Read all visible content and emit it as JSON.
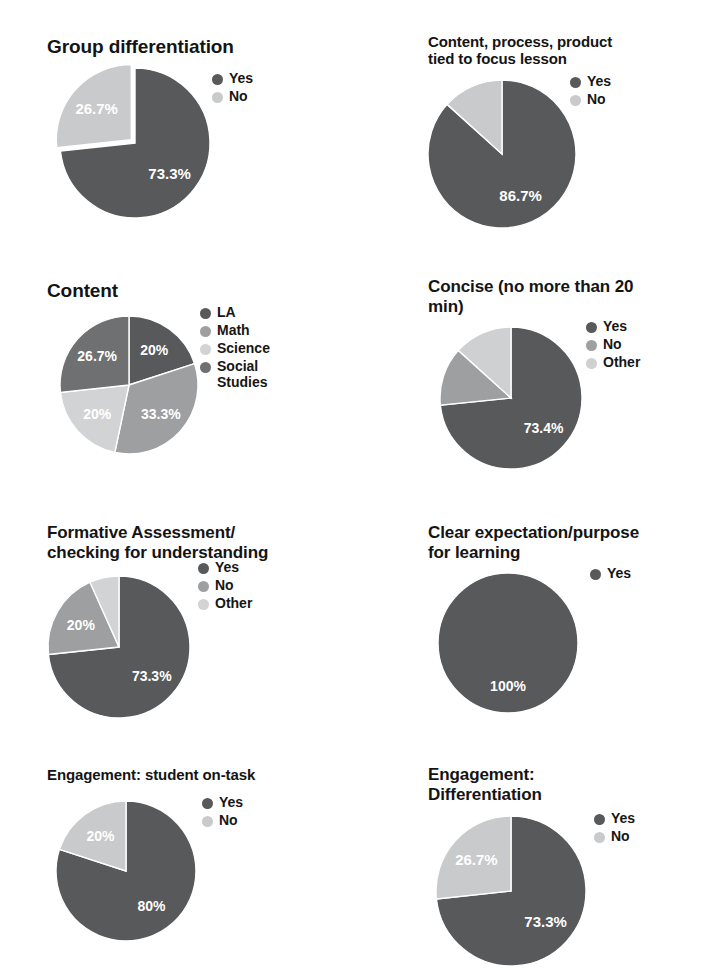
{
  "page": {
    "background": "#ffffff",
    "layout": "2 columns x 4 rows of pie charts"
  },
  "palette": {
    "dark": "#58595b",
    "medium": "#8c8d8f",
    "light": "#c9cacb",
    "lighter": "#dcdddd",
    "label_text": "#ffffff",
    "title_text": "#141414"
  },
  "chart_data": [
    {
      "id": "group-differentiation",
      "type": "pie",
      "title": "Group differentiation",
      "categories": [
        "Yes",
        "No"
      ],
      "values": [
        73.3,
        26.7
      ],
      "labels": [
        "73.3%",
        "26.7%"
      ],
      "colors": [
        "#58595b",
        "#c9cacb"
      ],
      "legend": [
        "Yes",
        "No"
      ],
      "legend_position": "right",
      "exploded": [
        "No"
      ]
    },
    {
      "id": "content-process-product",
      "type": "pie",
      "title": "Content, process, product tied to focus lesson",
      "categories": [
        "Yes",
        "No"
      ],
      "values": [
        86.7,
        13.3
      ],
      "labels": [
        "86.7%",
        ""
      ],
      "colors": [
        "#58595b",
        "#c9cacb"
      ],
      "legend": [
        "Yes",
        "No"
      ],
      "legend_position": "right",
      "exploded": []
    },
    {
      "id": "content",
      "type": "pie",
      "title": "Content",
      "categories": [
        "LA",
        "Math",
        "Science",
        "Social Studies"
      ],
      "values": [
        20,
        33.3,
        20,
        26.7
      ],
      "labels": [
        "20%",
        "33.3%",
        "20%",
        "26.7%"
      ],
      "colors": [
        "#58595b",
        "#9e9fa1",
        "#d2d3d4",
        "#6f7072"
      ],
      "legend": [
        "LA",
        "Math",
        "Science",
        "Social\nStudies"
      ],
      "legend_position": "right",
      "exploded": []
    },
    {
      "id": "concise",
      "type": "pie",
      "title": "Concise (no more than 20 min)",
      "categories": [
        "Yes",
        "No",
        "Other"
      ],
      "values": [
        73.4,
        13.3,
        13.3
      ],
      "labels": [
        "73.4%",
        "",
        ""
      ],
      "colors": [
        "#58595b",
        "#9e9fa1",
        "#cfd0d1"
      ],
      "legend": [
        "Yes",
        "No",
        "Other"
      ],
      "legend_position": "right",
      "exploded": []
    },
    {
      "id": "formative-assessment",
      "type": "pie",
      "title": "Formative Assessment/ checking for understanding",
      "categories": [
        "Yes",
        "No",
        "Other"
      ],
      "values": [
        73.3,
        20,
        6.7
      ],
      "labels": [
        "73.3%",
        "20%",
        ""
      ],
      "colors": [
        "#58595b",
        "#9e9fa1",
        "#d2d3d4"
      ],
      "legend": [
        "Yes",
        "No",
        "Other"
      ],
      "legend_position": "right",
      "exploded": []
    },
    {
      "id": "clear-expectation",
      "type": "pie",
      "title": "Clear expectation/purpose for learning",
      "categories": [
        "Yes"
      ],
      "values": [
        100
      ],
      "labels": [
        "100%"
      ],
      "colors": [
        "#58595b"
      ],
      "legend": [
        "Yes"
      ],
      "legend_position": "right",
      "exploded": []
    },
    {
      "id": "engagement-student-on-task",
      "type": "pie",
      "title": "Engagement: student on-task",
      "categories": [
        "Yes",
        "No"
      ],
      "values": [
        80,
        20
      ],
      "labels": [
        "80%",
        "20%"
      ],
      "colors": [
        "#58595b",
        "#c9cacb"
      ],
      "legend": [
        "Yes",
        "No"
      ],
      "legend_position": "right",
      "exploded": []
    },
    {
      "id": "engagement-differentiation",
      "type": "pie",
      "title": "Engagement: Differentiation",
      "categories": [
        "Yes",
        "No"
      ],
      "values": [
        73.3,
        26.7
      ],
      "labels": [
        "73.3%",
        "26.7%"
      ],
      "colors": [
        "#58595b",
        "#c9cacb"
      ],
      "legend": [
        "Yes",
        "No"
      ],
      "legend_position": "right",
      "exploded": []
    }
  ],
  "titles": {
    "t0": "Group differentiation",
    "t1": "Content, process, product\ntied to focus lesson",
    "t2": "Content",
    "t3": "Concise (no more than 20\nmin)",
    "t4": "Formative Assessment/\nchecking for understanding",
    "t5": "Clear expectation/purpose\nfor learning",
    "t6": "Engagement: student on-task",
    "t7": "Engagement:\nDifferentiation"
  }
}
